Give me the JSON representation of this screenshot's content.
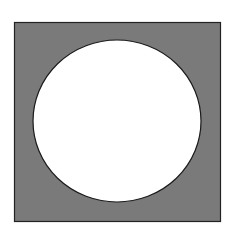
{
  "figure": {
    "shapes": [
      {
        "type": "square",
        "fill": "#7a7a7a",
        "stroke": "#222222"
      },
      {
        "type": "circle",
        "fill": "#ffffff",
        "stroke": "#1a1a1a"
      }
    ]
  }
}
